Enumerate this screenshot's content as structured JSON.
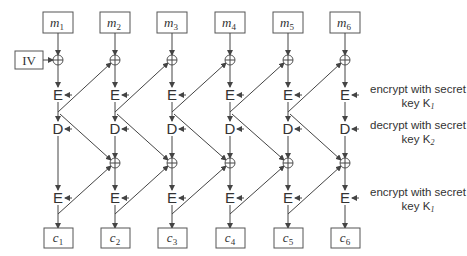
{
  "diagram": {
    "columns": [
      {
        "input": "m",
        "input_sub": "1",
        "output": "c",
        "output_sub": "1"
      },
      {
        "input": "m",
        "input_sub": "2",
        "output": "c",
        "output_sub": "2"
      },
      {
        "input": "m",
        "input_sub": "3",
        "output": "c",
        "output_sub": "3"
      },
      {
        "input": "m",
        "input_sub": "4",
        "output": "c",
        "output_sub": "4"
      },
      {
        "input": "m",
        "input_sub": "5",
        "output": "c",
        "output_sub": "5"
      },
      {
        "input": "m",
        "input_sub": "6",
        "output": "c",
        "output_sub": "6"
      }
    ],
    "iv_label": "IV",
    "encrypt_op": "E",
    "decrypt_op": "D",
    "xor_symbol": "⊕",
    "annotations": [
      {
        "line1": "encrypt with secret",
        "line2": "key K",
        "sub": "1"
      },
      {
        "line1": "decrypt with secret",
        "line2": "key K",
        "sub": "2"
      },
      {
        "line1": "encrypt with secret",
        "line2": "key K",
        "sub": "1"
      }
    ]
  }
}
